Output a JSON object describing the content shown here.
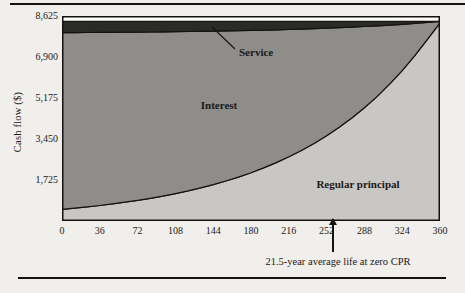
{
  "figure": {
    "y_axis_title": "Cash flow ($)"
  },
  "colors": {
    "paper": "#f1efec",
    "plot_background": "#fbfaf7",
    "service_fill": "#2a2a29",
    "interest_fill": "#8e8d8a",
    "principal_fill": "#c9c7c3",
    "line": "#151311",
    "text": "#1b1917"
  },
  "chart_data": {
    "type": "area",
    "stacked": true,
    "title": "",
    "xlabel": "",
    "ylabel": "Cash flow ($)",
    "xlim": [
      0,
      360
    ],
    "ylim": [
      0,
      8625
    ],
    "grid": false,
    "legend": "labels drawn inside areas",
    "x_ticks": [
      0,
      36,
      72,
      108,
      144,
      180,
      216,
      252,
      288,
      324,
      360
    ],
    "y_ticks": [
      {
        "v": 1725,
        "label": "1,725"
      },
      {
        "v": 3450,
        "label": "3,450"
      },
      {
        "v": 5175,
        "label": "5,175"
      },
      {
        "v": 6900,
        "label": "6,900"
      },
      {
        "v": 8625,
        "label": "8,625"
      }
    ],
    "x": [
      0,
      12,
      24,
      36,
      48,
      60,
      72,
      84,
      96,
      108,
      120,
      132,
      144,
      156,
      168,
      180,
      192,
      204,
      216,
      228,
      240,
      252,
      264,
      276,
      288,
      300,
      312,
      324,
      336,
      348,
      360
    ],
    "series": [
      {
        "id": "regular-principal",
        "name": "Regular principal",
        "color": "#c9c7c3",
        "values": [
          492,
          540,
          594,
          653,
          718,
          789,
          867,
          953,
          1048,
          1152,
          1266,
          1392,
          1530,
          1682,
          1849,
          2032,
          2234,
          2456,
          2699,
          2967,
          3262,
          3585,
          3941,
          4332,
          4762,
          5235,
          5754,
          6325,
          6953,
          7643,
          8334
        ],
        "label": {
          "x": 296,
          "y": 172,
          "anchor": "middle"
        }
      },
      {
        "id": "interest",
        "name": "Interest",
        "color": "#8e8d8a",
        "values": [
          7434,
          7388,
          7338,
          7282,
          7221,
          7154,
          7081,
          7000,
          6911,
          6813,
          6706,
          6588,
          6458,
          6315,
          6158,
          5986,
          5796,
          5587,
          5359,
          5107,
          4830,
          4526,
          4191,
          3824,
          3420,
          2975,
          2487,
          1950,
          1360,
          712,
          62
        ],
        "label": {
          "x": 157,
          "y": 93,
          "anchor": "middle"
        }
      },
      {
        "id": "service",
        "name": "Service",
        "color": "#2a2a29",
        "values": [
          474,
          472,
          468,
          465,
          461,
          457,
          452,
          447,
          441,
          435,
          428,
          420,
          412,
          403,
          393,
          382,
          370,
          357,
          342,
          326,
          308,
          289,
          268,
          244,
          218,
          190,
          159,
          125,
          87,
          45,
          4
        ],
        "label": {
          "x": 177,
          "y": 40,
          "anchor": "start"
        },
        "leader_line": {
          "x1": 150,
          "y1": 11,
          "x2": 173,
          "y2": 33
        }
      }
    ],
    "annotation": {
      "text": "21.5-year average life at zero CPR",
      "x_month": 258
    },
    "plot": {
      "left": 62,
      "top": 16,
      "width": 378,
      "height": 205
    }
  }
}
